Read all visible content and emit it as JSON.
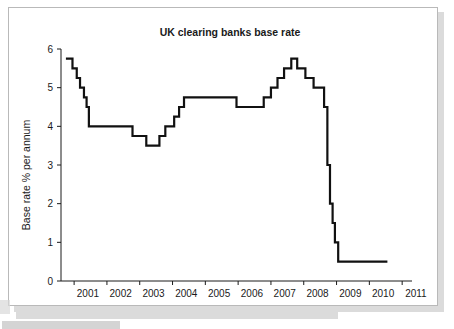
{
  "figure": {
    "frame_color": "#b9b9b9",
    "background": "#ffffff"
  },
  "chart_data": {
    "type": "line",
    "title": "UK clearing banks base rate",
    "xlabel": "",
    "ylabel": "Base rate % per annum",
    "line_color": "#111111",
    "grid": false,
    "legend": "none",
    "step_style": "post",
    "xlim": [
      2000.6,
      2011.3
    ],
    "ylim": [
      0,
      6
    ],
    "yticks": [
      0,
      1,
      2,
      3,
      4,
      5,
      6
    ],
    "ytick_labels": [
      "0",
      "1",
      "2",
      "3",
      "4",
      "5",
      "6"
    ],
    "xticks": [
      2001,
      2002,
      2003,
      2004,
      2005,
      2006,
      2007,
      2008,
      2009,
      2010,
      2011
    ],
    "xtick_labels": [
      "2001",
      "2002",
      "2003",
      "2004",
      "2005",
      "2006",
      "2007",
      "2008",
      "2009",
      "2010",
      "2011"
    ],
    "x": [
      2000.75,
      2000.95,
      2001.08,
      2001.18,
      2001.3,
      2001.38,
      2001.45,
      2001.55,
      2002.6,
      2002.78,
      2003.05,
      2003.2,
      2003.45,
      2003.6,
      2003.78,
      2003.92,
      2004.05,
      2004.2,
      2004.35,
      2005.5,
      2005.95,
      2006.25,
      2006.6,
      2006.78,
      2007.0,
      2007.2,
      2007.4,
      2007.62,
      2007.8,
      2008.05,
      2008.3,
      2008.62,
      2008.72,
      2008.8,
      2008.88,
      2008.95,
      2009.05,
      2009.15,
      2010.55
    ],
    "y": [
      5.75,
      5.5,
      5.25,
      5.0,
      4.75,
      4.5,
      4.0,
      4.0,
      4.0,
      3.75,
      3.75,
      3.5,
      3.5,
      3.75,
      4.0,
      4.0,
      4.25,
      4.5,
      4.75,
      4.75,
      4.5,
      4.5,
      4.5,
      4.75,
      5.0,
      5.25,
      5.5,
      5.75,
      5.5,
      5.25,
      5.0,
      4.5,
      3.0,
      2.0,
      1.5,
      1.0,
      0.5,
      0.5,
      0.5
    ],
    "series": [
      {
        "name": "UK clearing banks base rate",
        "values": [
          5.75,
          5.5,
          5.25,
          5.0,
          4.75,
          4.5,
          4.0,
          4.0,
          4.0,
          3.75,
          3.75,
          3.5,
          3.5,
          3.75,
          4.0,
          4.0,
          4.25,
          4.5,
          4.75,
          4.75,
          4.5,
          4.5,
          4.5,
          4.75,
          5.0,
          5.25,
          5.5,
          5.75,
          5.5,
          5.25,
          5.0,
          4.5,
          3.0,
          2.0,
          1.5,
          1.0,
          0.5,
          0.5,
          0.5
        ]
      }
    ],
    "annotations": []
  }
}
